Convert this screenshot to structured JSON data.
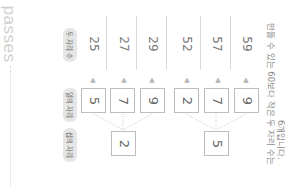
{
  "brand": {
    "text": "passes"
  },
  "labels": {
    "two_digit": "두 자리 수",
    "ones": "일의 자리",
    "tens": "십의 자리"
  },
  "tens_digits": [
    "2",
    "5"
  ],
  "ones_digits": [
    "5",
    "7",
    "9",
    "2",
    "7",
    "9"
  ],
  "results": [
    "25",
    "27",
    "29",
    "52",
    "57",
    "59"
  ],
  "arrow_icon": "up-arrow",
  "caption": {
    "line1": "만들 수 있는 60보다 작은 두 자리 수는",
    "line2": "6개입니다."
  },
  "colors": {
    "pill_bg": "#e6e6e6",
    "box_border": "#bdbdbd",
    "text": "#777777",
    "brand": "#cfcfcf"
  }
}
